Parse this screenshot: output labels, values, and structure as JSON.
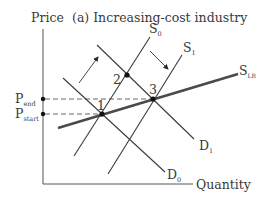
{
  "title": "(a) Increasing-cost industry",
  "axes": {
    "y_label": "Price",
    "x_label": "Quantity"
  },
  "price_levels": {
    "end": {
      "main": "P",
      "sub": "end"
    },
    "start": {
      "main": "P",
      "sub": "start"
    }
  },
  "curves": {
    "S0": {
      "main": "S",
      "sub": "0"
    },
    "S1": {
      "main": "S",
      "sub": "1"
    },
    "SLR": {
      "main": "S",
      "sub": "LR"
    },
    "D0": {
      "main": "D",
      "sub": "0"
    },
    "D1": {
      "main": "D",
      "sub": "1"
    }
  },
  "points": [
    {
      "label": "1"
    },
    {
      "label": "2"
    },
    {
      "label": "3"
    }
  ],
  "colors": {
    "line": "#3a3a3a",
    "thick_line": "#4a4a4a",
    "background": "#ffffff"
  }
}
